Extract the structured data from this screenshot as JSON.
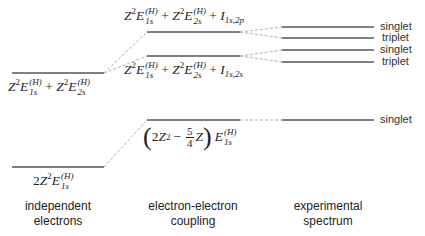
{
  "diagram": {
    "type": "energy-level-diagram",
    "columns": [
      {
        "id": "independent",
        "caption_line1": "independent",
        "caption_line2": "electrons"
      },
      {
        "id": "coupling",
        "caption_line1": "electron-electron",
        "caption_line2": "coupling"
      },
      {
        "id": "experimental",
        "caption_line1": "experimental",
        "caption_line2": "spectrum"
      }
    ],
    "levels": {
      "independent_excited": {
        "label": "Z²E₁ₛ⁽ᴴ⁾ + Z²E₂ₛ⁽ᴴ⁾"
      },
      "independent_ground": {
        "label": "2Z²E₁ₛ⁽ᴴ⁾"
      },
      "coupling_2p": {
        "label": "Z²E₁ₛ⁽ᴴ⁾ + Z²E₂ₛ⁽ᴴ⁾ + I₁ₛ,₂ₚ"
      },
      "coupling_2s": {
        "label": "Z²E₁ₛ⁽ᴴ⁾ + Z²E₂ₛ⁽ᴴ⁾ + I₁ₛ,₂ₛ"
      },
      "coupling_ground": {
        "label": "(2Z² − 5/4 Z) E₁ₛ⁽ᴴ⁾"
      }
    },
    "spectrum_states": [
      "singlet",
      "triplet",
      "singlet",
      "triplet",
      "singlet"
    ],
    "math": {
      "Z": "Z",
      "sq": "2",
      "E": "E",
      "H": "(H)",
      "s1": "1s",
      "s2": "2s",
      "plus": "+",
      "I": "I",
      "i2p": "1s,2p",
      "i2s": "1s,2s",
      "two": "2",
      "minus": "−",
      "five": "5",
      "four": "4",
      "lp": "(",
      "rp": ")"
    },
    "colors": {
      "level_line": "#808080",
      "dashed_connector": "#b0b0b0",
      "text": "#222222"
    }
  }
}
